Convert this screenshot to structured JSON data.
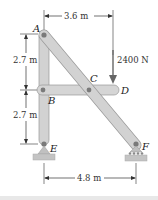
{
  "diagram": {
    "type": "frame-structure",
    "points": {
      "A": {
        "label": "A"
      },
      "B": {
        "label": "B"
      },
      "C": {
        "label": "C"
      },
      "D": {
        "label": "D"
      },
      "E": {
        "label": "E"
      },
      "F": {
        "label": "F"
      }
    },
    "dimensions": {
      "top_horizontal": "3.6 m",
      "upper_vertical": "2.7 m",
      "lower_vertical": "2.7 m",
      "bottom_horizontal": "4.8 m"
    },
    "load": {
      "value": "2400 N",
      "direction": "down",
      "at": "D"
    },
    "supports": {
      "E": "pin",
      "F": "roller"
    },
    "colors": {
      "member": "#d2d2d2",
      "member_edge": "#9a9a9a",
      "pin": "#7a7a7a",
      "ground": "#c4c4c4",
      "dim_line": "#333333"
    }
  }
}
